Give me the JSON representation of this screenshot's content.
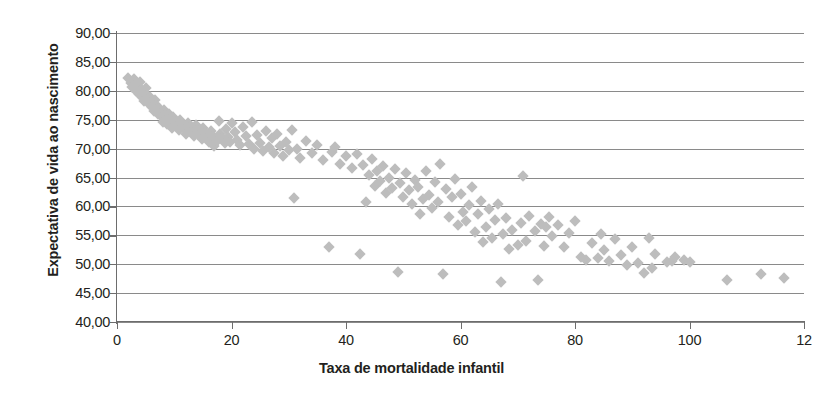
{
  "chart_data": {
    "type": "scatter",
    "title": "",
    "xlabel": "Taxa de mortalidade infantil",
    "ylabel": "Expectativa de vida ao nascimento",
    "xlim": [
      0,
      120
    ],
    "ylim": [
      40,
      90
    ],
    "xticks": [
      0,
      20,
      40,
      60,
      80,
      100,
      120
    ],
    "xtick_labels": [
      "0",
      "20",
      "40",
      "60",
      "80",
      "100",
      "12"
    ],
    "yticks": [
      40,
      45,
      50,
      55,
      60,
      65,
      70,
      75,
      80,
      85,
      90
    ],
    "ytick_labels": [
      "40,00",
      "45,00",
      "50,00",
      "55,00",
      "60,00",
      "65,00",
      "70,00",
      "75,00",
      "80,00",
      "85,00",
      "90,00"
    ],
    "grid": "horizontal",
    "legend": "none",
    "marker": "diamond",
    "marker_color": "#bdbdbd",
    "grid_color": "#8a8a8a",
    "axis_color": "#6d6d6d",
    "text_color": "#231f20",
    "points": [
      [
        2.0,
        82.2
      ],
      [
        2.4,
        81.4
      ],
      [
        2.6,
        80.6
      ],
      [
        3.0,
        82.0
      ],
      [
        3.2,
        81.0
      ],
      [
        3.4,
        79.9
      ],
      [
        3.6,
        80.8
      ],
      [
        3.8,
        79.4
      ],
      [
        4.0,
        81.5
      ],
      [
        4.2,
        80.2
      ],
      [
        4.4,
        78.9
      ],
      [
        4.6,
        79.8
      ],
      [
        4.8,
        78.2
      ],
      [
        5.0,
        80.5
      ],
      [
        5.2,
        79.2
      ],
      [
        5.4,
        78.5
      ],
      [
        5.6,
        77.8
      ],
      [
        5.8,
        79.0
      ],
      [
        6.0,
        78.0
      ],
      [
        6.2,
        77.2
      ],
      [
        6.4,
        76.5
      ],
      [
        6.6,
        78.4
      ],
      [
        6.8,
        77.5
      ],
      [
        7.0,
        76.8
      ],
      [
        7.2,
        75.9
      ],
      [
        7.4,
        77.0
      ],
      [
        7.6,
        76.2
      ],
      [
        7.8,
        75.4
      ],
      [
        8.0,
        74.6
      ],
      [
        8.2,
        76.6
      ],
      [
        8.4,
        75.8
      ],
      [
        8.6,
        75.0
      ],
      [
        8.8,
        74.2
      ],
      [
        9.0,
        76.0
      ],
      [
        9.2,
        75.2
      ],
      [
        9.4,
        74.4
      ],
      [
        9.6,
        73.6
      ],
      [
        9.8,
        75.5
      ],
      [
        10.0,
        74.8
      ],
      [
        10.4,
        73.9
      ],
      [
        10.8,
        73.2
      ],
      [
        11.0,
        75.0
      ],
      [
        11.4,
        74.2
      ],
      [
        11.8,
        73.4
      ],
      [
        12.0,
        72.6
      ],
      [
        12.4,
        74.5
      ],
      [
        12.8,
        73.7
      ],
      [
        13.0,
        72.9
      ],
      [
        13.4,
        72.1
      ],
      [
        13.8,
        74.0
      ],
      [
        14.0,
        73.2
      ],
      [
        14.4,
        72.4
      ],
      [
        14.8,
        71.6
      ],
      [
        15.0,
        73.5
      ],
      [
        15.4,
        72.7
      ],
      [
        15.8,
        71.9
      ],
      [
        16.0,
        71.1
      ],
      [
        16.4,
        73.0
      ],
      [
        16.8,
        72.2
      ],
      [
        17.0,
        70.4
      ],
      [
        17.4,
        71.4
      ],
      [
        17.8,
        74.8
      ],
      [
        18.0,
        72.6
      ],
      [
        18.4,
        71.8
      ],
      [
        18.8,
        70.9
      ],
      [
        19.0,
        73.4
      ],
      [
        19.4,
        72.0
      ],
      [
        19.8,
        71.2
      ],
      [
        20.0,
        74.4
      ],
      [
        20.6,
        72.8
      ],
      [
        21.0,
        71.5
      ],
      [
        21.5,
        70.6
      ],
      [
        22.0,
        73.8
      ],
      [
        22.5,
        72.2
      ],
      [
        23.0,
        70.8
      ],
      [
        23.5,
        74.6
      ],
      [
        24.0,
        69.9
      ],
      [
        24.5,
        72.4
      ],
      [
        25.0,
        71.0
      ],
      [
        25.5,
        69.6
      ],
      [
        26.0,
        73.0
      ],
      [
        26.5,
        70.2
      ],
      [
        27.0,
        71.8
      ],
      [
        27.5,
        69.2
      ],
      [
        28.0,
        72.5
      ],
      [
        28.5,
        70.5
      ],
      [
        29.0,
        68.8
      ],
      [
        29.5,
        71.2
      ],
      [
        30.0,
        69.8
      ],
      [
        30.5,
        73.2
      ],
      [
        31.0,
        61.5
      ],
      [
        31.5,
        70.0
      ],
      [
        32.0,
        68.4
      ],
      [
        33.0,
        71.4
      ],
      [
        34.0,
        69.2
      ],
      [
        35.0,
        70.6
      ],
      [
        36.0,
        68.0
      ],
      [
        37.0,
        53.0
      ],
      [
        37.5,
        69.4
      ],
      [
        38.0,
        70.2
      ],
      [
        39.0,
        67.4
      ],
      [
        40.0,
        68.8
      ],
      [
        41.0,
        66.6
      ],
      [
        42.0,
        69.0
      ],
      [
        42.5,
        51.8
      ],
      [
        43.0,
        67.2
      ],
      [
        43.5,
        60.8
      ],
      [
        44.0,
        65.4
      ],
      [
        44.5,
        68.2
      ],
      [
        45.0,
        63.6
      ],
      [
        45.5,
        66.2
      ],
      [
        46.0,
        64.4
      ],
      [
        46.5,
        67.0
      ],
      [
        47.0,
        62.4
      ],
      [
        47.5,
        65.0
      ],
      [
        48.0,
        63.2
      ],
      [
        48.5,
        66.4
      ],
      [
        49.0,
        48.7
      ],
      [
        49.5,
        64.0
      ],
      [
        50.0,
        61.6
      ],
      [
        50.5,
        65.8
      ],
      [
        51.0,
        62.8
      ],
      [
        51.5,
        60.4
      ],
      [
        52.0,
        64.6
      ],
      [
        52.5,
        63.4
      ],
      [
        53.0,
        58.6
      ],
      [
        53.5,
        61.2
      ],
      [
        54.0,
        66.2
      ],
      [
        54.5,
        62.0
      ],
      [
        55.0,
        59.8
      ],
      [
        55.5,
        64.2
      ],
      [
        56.0,
        60.8
      ],
      [
        56.5,
        67.4
      ],
      [
        57.0,
        48.3
      ],
      [
        57.5,
        63.0
      ],
      [
        58.0,
        58.2
      ],
      [
        58.5,
        61.6
      ],
      [
        59.0,
        64.8
      ],
      [
        59.5,
        56.8
      ],
      [
        60.0,
        62.2
      ],
      [
        60.5,
        59.0
      ],
      [
        61.0,
        57.4
      ],
      [
        61.5,
        60.2
      ],
      [
        62.0,
        63.4
      ],
      [
        62.5,
        55.6
      ],
      [
        63.0,
        58.6
      ],
      [
        63.5,
        61.0
      ],
      [
        64.0,
        53.8
      ],
      [
        64.5,
        56.4
      ],
      [
        65.0,
        59.6
      ],
      [
        65.5,
        54.6
      ],
      [
        66.0,
        57.6
      ],
      [
        66.5,
        60.4
      ],
      [
        67.0,
        47.0
      ],
      [
        67.5,
        55.2
      ],
      [
        68.0,
        58.0
      ],
      [
        68.5,
        52.6
      ],
      [
        69.0,
        56.0
      ],
      [
        70.0,
        53.4
      ],
      [
        70.5,
        57.2
      ],
      [
        71.0,
        65.3
      ],
      [
        71.5,
        54.0
      ],
      [
        72.0,
        58.4
      ],
      [
        73.0,
        55.8
      ],
      [
        73.5,
        47.2
      ],
      [
        74.0,
        57.0
      ],
      [
        74.5,
        53.2
      ],
      [
        75.0,
        56.4
      ],
      [
        75.5,
        58.2
      ],
      [
        76.0,
        54.8
      ],
      [
        77.0,
        56.8
      ],
      [
        78.0,
        53.0
      ],
      [
        79.0,
        55.4
      ],
      [
        80.0,
        57.4
      ],
      [
        81.0,
        51.2
      ],
      [
        82.0,
        50.8
      ],
      [
        83.0,
        53.6
      ],
      [
        84.0,
        51.0
      ],
      [
        84.5,
        55.2
      ],
      [
        85.0,
        52.4
      ],
      [
        86.0,
        50.6
      ],
      [
        87.0,
        54.4
      ],
      [
        88.0,
        51.6
      ],
      [
        89.0,
        49.8
      ],
      [
        90.0,
        53.0
      ],
      [
        91.0,
        50.2
      ],
      [
        92.0,
        48.4
      ],
      [
        93.0,
        54.6
      ],
      [
        93.5,
        49.4
      ],
      [
        94.0,
        51.8
      ],
      [
        96.0,
        50.4
      ],
      [
        97.0,
        50.6
      ],
      [
        97.5,
        51.2
      ],
      [
        99.0,
        50.8
      ],
      [
        100.0,
        50.4
      ],
      [
        106.5,
        47.3
      ],
      [
        112.5,
        48.3
      ],
      [
        116.5,
        47.6
      ]
    ]
  }
}
